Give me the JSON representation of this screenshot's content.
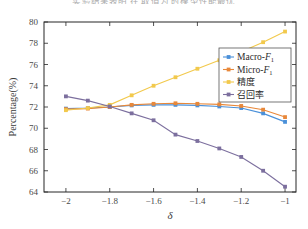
{
  "figure": {
    "caption_remnant": "实验结果表明 在 取值为 时模型性能最优",
    "background_color": "#ffffff",
    "frame_color": "#262626"
  },
  "chart_data": {
    "type": "line",
    "title": "",
    "xlabel": "δ",
    "ylabel": "Percentage(%)",
    "xlim": [
      -2.1,
      -0.95
    ],
    "ylim": [
      64,
      80
    ],
    "xticks": [
      -2,
      -1.8,
      -1.6,
      -1.4,
      -1.2,
      -1
    ],
    "xticklabels": [
      "−2",
      "−1.8",
      "−1.6",
      "−1.4",
      "−1.2",
      "−1"
    ],
    "yticks": [
      64,
      66,
      68,
      70,
      72,
      74,
      76,
      78,
      80
    ],
    "yticklabels": [
      "64",
      "66",
      "68",
      "70",
      "72",
      "74",
      "76",
      "78",
      "80"
    ],
    "grid": false,
    "legend_position": "upper right",
    "x": [
      -2.0,
      -1.9,
      -1.8,
      -1.7,
      -1.6,
      -1.5,
      -1.4,
      -1.3,
      -1.2,
      -1.1,
      -1.0
    ],
    "series": [
      {
        "name": "Macro-F1",
        "label_main": "Macro-",
        "label_italic": "F",
        "label_sub": "1",
        "color": "#4a90d9",
        "marker": "square",
        "values": [
          71.85,
          71.9,
          72.0,
          72.15,
          72.2,
          72.2,
          72.15,
          72.05,
          71.9,
          71.4,
          70.6
        ]
      },
      {
        "name": "Micro-F1",
        "label_main": "Micro-",
        "label_italic": "F",
        "label_sub": "1",
        "color": "#e8883a",
        "marker": "square",
        "values": [
          71.8,
          71.85,
          72.0,
          72.2,
          72.3,
          72.35,
          72.3,
          72.25,
          72.1,
          71.75,
          71.05
        ]
      },
      {
        "name": "精度",
        "label_main": "精度",
        "label_italic": "",
        "label_sub": "",
        "color": "#f2c94c",
        "marker": "square",
        "values": [
          71.7,
          71.9,
          72.2,
          73.1,
          74.0,
          74.8,
          75.6,
          76.4,
          77.2,
          78.1,
          79.1
        ]
      },
      {
        "name": "召回率",
        "label_main": "召回率",
        "label_italic": "",
        "label_sub": "",
        "color": "#7c6f9e",
        "marker": "square",
        "values": [
          73.0,
          72.6,
          72.05,
          71.4,
          70.75,
          69.4,
          68.8,
          68.1,
          67.3,
          66.0,
          64.5
        ]
      }
    ]
  }
}
